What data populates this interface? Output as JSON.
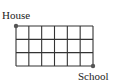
{
  "diagram": {
    "type": "grid-path",
    "labels": {
      "start": "House",
      "end": "School"
    },
    "grid": {
      "columns": 6,
      "rows": 3,
      "left": 16,
      "top": 26,
      "right": 93,
      "bottom": 66,
      "line_color": "#333333",
      "dot_color": "#555555"
    }
  }
}
